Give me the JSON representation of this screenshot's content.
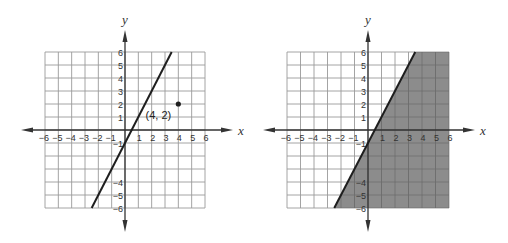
{
  "chart_data": [
    {
      "type": "line",
      "title": "",
      "xlabel": "x",
      "ylabel": "y",
      "xlim": [
        -6,
        6
      ],
      "ylim": [
        -6,
        6
      ],
      "grid": true,
      "x_ticks": [
        -6,
        -5,
        -4,
        -3,
        -2,
        -1,
        1,
        2,
        3,
        4,
        5,
        6
      ],
      "y_ticks": [
        6,
        5,
        4,
        3,
        2,
        1,
        -1,
        -4,
        -5,
        -6
      ],
      "series": [
        {
          "name": "line",
          "equation": "y = 2x - 1",
          "points": [
            [
              -2.5,
              -6
            ],
            [
              3.5,
              6
            ]
          ]
        }
      ],
      "points": [
        {
          "x": 4,
          "y": 2,
          "label": "(4, 2)"
        }
      ],
      "shaded": null
    },
    {
      "type": "area",
      "title": "",
      "xlabel": "x",
      "ylabel": "y",
      "xlim": [
        -6,
        6
      ],
      "ylim": [
        -6,
        6
      ],
      "grid": true,
      "x_ticks": [
        -6,
        -5,
        -4,
        -3,
        -2,
        -1,
        1,
        2,
        3,
        4,
        5,
        6
      ],
      "y_ticks": [
        6,
        5,
        4,
        3,
        2,
        1,
        -1,
        -4,
        -5,
        -6
      ],
      "series": [
        {
          "name": "boundary",
          "equation": "y = 2x - 1",
          "points": [
            [
              -2.5,
              -6
            ],
            [
              3.5,
              6
            ]
          ]
        }
      ],
      "points": [],
      "shaded": {
        "region": "below-right of line (y < 2x - 1)",
        "color": "#8c8c8c"
      }
    }
  ],
  "colors": {
    "grid": "#9a9a9a",
    "axis": "#333333",
    "line": "#1e1e1e",
    "shade": "#8c8c8c",
    "shade_grid": "#6f6f6f"
  }
}
